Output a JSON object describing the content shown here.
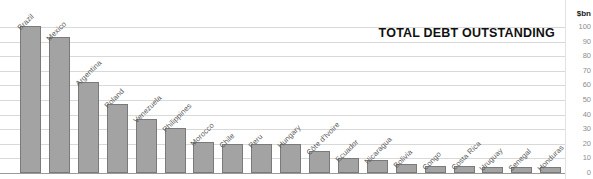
{
  "chart_data": {
    "type": "bar",
    "title": "TOTAL DEBT OUTSTANDING",
    "xlabel": "",
    "ylabel": "$bn",
    "unit_label": "$bn",
    "ylim": [
      0,
      100
    ],
    "yticks": [
      0,
      10,
      20,
      30,
      40,
      50,
      60,
      70,
      80,
      90,
      100
    ],
    "ytick_labels": [
      "0",
      "10",
      "20",
      "30",
      "40",
      "50",
      "60",
      "70",
      "80",
      "90",
      "100"
    ],
    "grid": true,
    "legend": "none",
    "axis_position": "right",
    "categories": [
      "Brazil",
      "Mexico",
      "Argentina",
      "Poland",
      "Venezuela",
      "Philippines",
      "Morocco",
      "Chile",
      "Peru",
      "Hungary",
      "Côte d'Ivoire",
      "Ecuador",
      "Nicaragua",
      "Bolivia",
      "Congo",
      "Costa Rica",
      "Uruguay",
      "Senegal",
      "Honduras"
    ],
    "values": [
      101,
      93,
      62,
      47,
      37,
      31,
      21,
      20,
      20,
      20,
      15,
      10,
      9,
      6,
      5,
      5,
      4,
      4,
      4
    ],
    "series": [
      {
        "name": "Total debt outstanding",
        "values": [
          101,
          93,
          62,
          47,
          37,
          31,
          21,
          20,
          20,
          20,
          15,
          10,
          9,
          6,
          5,
          5,
          4,
          4,
          4
        ]
      }
    ],
    "colors": {
      "bar_fill": "#a3a3a3",
      "bar_border": "#7a7a7a",
      "gridline": "#d9d9d9",
      "baseline": "#9a9a9a",
      "title_text": "#111111",
      "tick_text": "#8d8d8d",
      "category_text": "#5a5a5a",
      "background": "#ffffff"
    }
  }
}
